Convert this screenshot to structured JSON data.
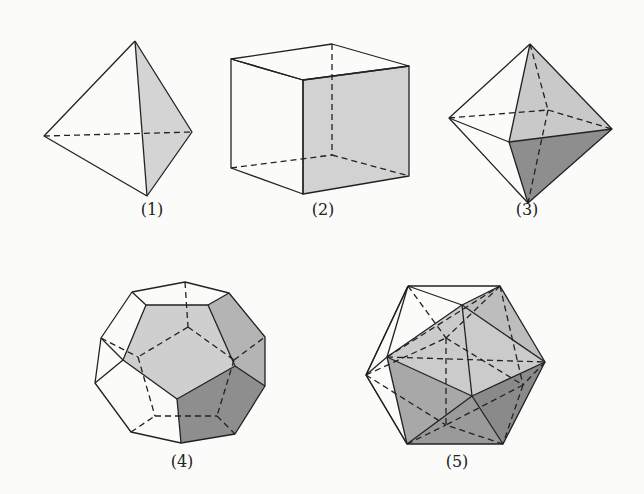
{
  "figure": {
    "items": [
      {
        "id": 1,
        "label": "(1)",
        "name": "tetrahedron",
        "label_pos": [
          152,
          208
        ]
      },
      {
        "id": 2,
        "label": "(2)",
        "name": "cube",
        "label_pos": [
          323,
          208
        ]
      },
      {
        "id": 3,
        "label": "(3)",
        "name": "octahedron",
        "label_pos": [
          527,
          208
        ]
      },
      {
        "id": 4,
        "label": "(4)",
        "name": "dodecahedron",
        "label_pos": [
          182,
          460
        ]
      },
      {
        "id": 5,
        "label": "(5)",
        "name": "icosahedron",
        "label_pos": [
          457,
          460
        ]
      }
    ]
  },
  "colors": {
    "background": "#fbfbfa",
    "stroke": "#222222",
    "shade_light": "#d6d6d6",
    "shade_mid": "#bdbdbd",
    "shade_dark": "#8c8c8c"
  }
}
